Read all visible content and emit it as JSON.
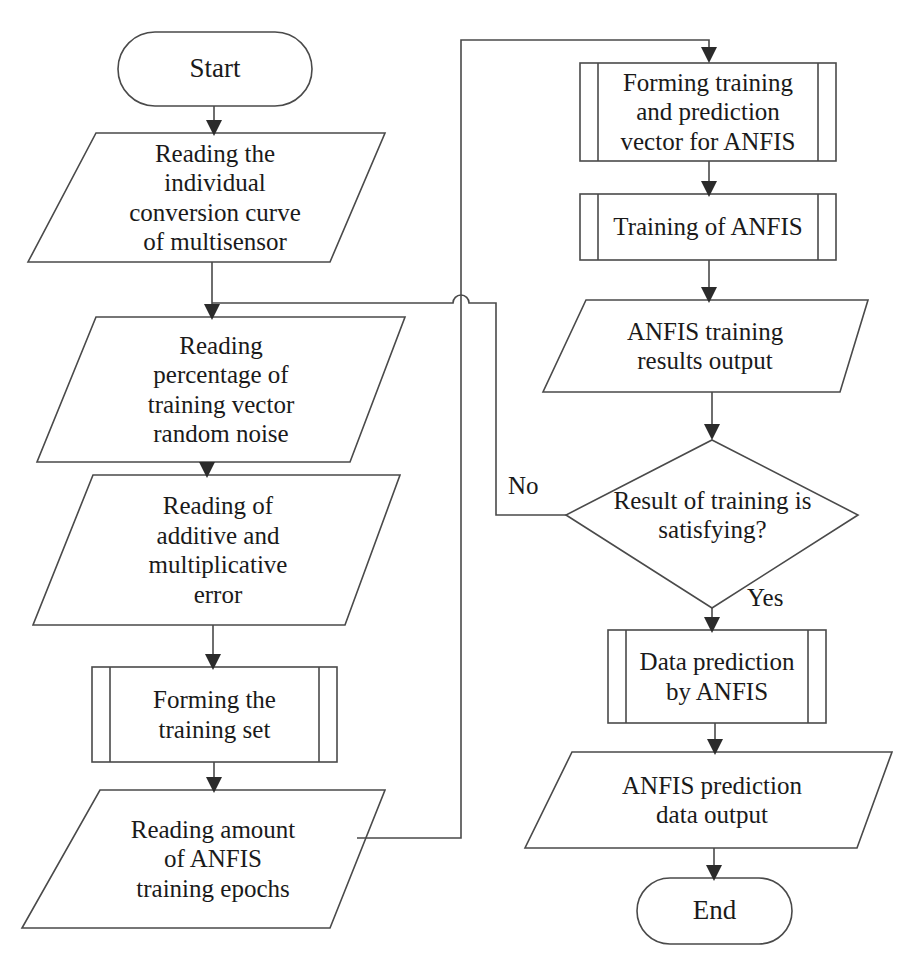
{
  "diagram": {
    "type": "flowchart",
    "stroke_color": "#4a4a4a",
    "text_color": "#1a1a1a",
    "background_color": "#ffffff"
  },
  "nodes": [
    {
      "id": "start",
      "shape": "terminator",
      "label": "Start",
      "column": "left"
    },
    {
      "id": "read_curve",
      "shape": "parallelogram",
      "label": "Reading the\nindividual\nconversion curve\nof multisensor",
      "column": "left"
    },
    {
      "id": "read_pct",
      "shape": "parallelogram",
      "label": "Reading\npercentage of\ntraining vector\nrandom noise",
      "column": "left"
    },
    {
      "id": "read_err",
      "shape": "parallelogram",
      "label": "Reading of\nadditive and\nmultiplicative\nerror",
      "column": "left"
    },
    {
      "id": "form_set",
      "shape": "predefined-process",
      "label": "Forming the\ntraining set",
      "column": "left"
    },
    {
      "id": "read_epochs",
      "shape": "parallelogram",
      "label": "Reading amount\nof ANFIS\ntraining epochs",
      "column": "left"
    },
    {
      "id": "form_vectors",
      "shape": "predefined-process",
      "label": "Forming training\nand prediction\nvector for ANFIS",
      "column": "right"
    },
    {
      "id": "train_anfis",
      "shape": "predefined-process",
      "label": "Training of ANFIS",
      "column": "right"
    },
    {
      "id": "train_out",
      "shape": "parallelogram",
      "label": "ANFIS training\nresults output",
      "column": "right"
    },
    {
      "id": "decision",
      "shape": "diamond",
      "label": "Result of training is\nsatisfying?",
      "column": "right"
    },
    {
      "id": "predict",
      "shape": "predefined-process",
      "label": "Data prediction\nby ANFIS",
      "column": "right"
    },
    {
      "id": "predict_out",
      "shape": "parallelogram",
      "label": "ANFIS prediction\ndata output",
      "column": "right"
    },
    {
      "id": "end",
      "shape": "terminator",
      "label": "End",
      "column": "right"
    }
  ],
  "edges": [
    {
      "id": "e1",
      "from": "start",
      "to": "read_curve",
      "label": ""
    },
    {
      "id": "e2",
      "from": "read_curve",
      "to": "read_pct",
      "label": ""
    },
    {
      "id": "e3",
      "from": "read_pct",
      "to": "read_err",
      "label": ""
    },
    {
      "id": "e4",
      "from": "read_err",
      "to": "form_set",
      "label": ""
    },
    {
      "id": "e5",
      "from": "form_set",
      "to": "read_epochs",
      "label": ""
    },
    {
      "id": "e6",
      "from": "read_epochs",
      "to": "form_vectors",
      "label": ""
    },
    {
      "id": "e7",
      "from": "form_vectors",
      "to": "train_anfis",
      "label": ""
    },
    {
      "id": "e8",
      "from": "train_anfis",
      "to": "train_out",
      "label": ""
    },
    {
      "id": "e9",
      "from": "train_out",
      "to": "decision",
      "label": ""
    },
    {
      "id": "e10",
      "from": "decision",
      "to": "read_pct",
      "label": "No"
    },
    {
      "id": "e11",
      "from": "decision",
      "to": "predict",
      "label": "Yes"
    },
    {
      "id": "e12",
      "from": "predict",
      "to": "predict_out",
      "label": ""
    },
    {
      "id": "e13",
      "from": "predict_out",
      "to": "end",
      "label": ""
    }
  ],
  "edge_labels": {
    "no": "No",
    "yes": "Yes"
  },
  "labels": {
    "start": "Start",
    "read_curve": "Reading the\nindividual\nconversion curve\nof multisensor",
    "read_pct": "Reading\npercentage of\ntraining vector\nrandom noise",
    "read_err": "Reading of\nadditive and\nmultiplicative\nerror",
    "form_set": "Forming the\ntraining set",
    "read_epochs": "Reading amount\nof ANFIS\ntraining epochs",
    "form_vectors": "Forming training\nand prediction\nvector for ANFIS",
    "train_anfis": "Training of ANFIS",
    "train_out": "ANFIS training\nresults output",
    "decision": "Result of training is\nsatisfying?",
    "predict": "Data prediction\nby ANFIS",
    "predict_out": "ANFIS prediction\ndata output",
    "end": "End"
  }
}
